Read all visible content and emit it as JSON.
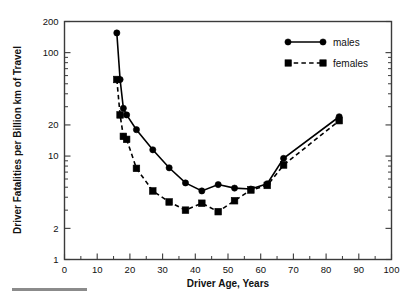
{
  "chart_data": {
    "type": "line",
    "title": "",
    "xlabel": "Driver Age, Years",
    "ylabel": "Driver Fatalities per Billion km of Travel",
    "yscale": "log",
    "xlim": [
      0,
      100
    ],
    "ylim": [
      1,
      200
    ],
    "grid": false,
    "legend_position": "top-right",
    "x_ticks": [
      0,
      10,
      20,
      30,
      40,
      50,
      60,
      70,
      80,
      90,
      100
    ],
    "x_tick_labels": [
      "0",
      "10",
      "20",
      "30",
      "40",
      "50",
      "60",
      "70",
      "80",
      "90",
      "100"
    ],
    "x_minor_ticks": [
      5,
      15,
      25,
      35,
      45,
      55,
      65,
      75,
      85,
      95
    ],
    "y_ticks": [
      1,
      2,
      10,
      20,
      100,
      200
    ],
    "y_tick_labels": [
      "1",
      "2",
      "10",
      "20",
      "100",
      "200"
    ],
    "y_minor_ticks": [
      3,
      4,
      5,
      6,
      7,
      8,
      9,
      30,
      40,
      50,
      60,
      70,
      80,
      90
    ],
    "series": [
      {
        "name": "males",
        "marker": "circle",
        "line": "solid",
        "color": "#000000",
        "x": [
          16,
          17,
          18,
          19,
          22,
          27,
          32,
          37,
          42,
          47,
          52,
          57,
          62,
          67,
          84
        ],
        "y": [
          155,
          55,
          29,
          25,
          18,
          11.5,
          7.7,
          5.5,
          4.6,
          5.3,
          4.9,
          4.8,
          5.4,
          9.5,
          24
        ]
      },
      {
        "name": "females",
        "marker": "square",
        "line": "dashed",
        "color": "#000000",
        "x": [
          16,
          17,
          18,
          19,
          22,
          27,
          32,
          37,
          42,
          47,
          52,
          57,
          62,
          67,
          84
        ],
        "y": [
          55,
          25,
          15.5,
          14.5,
          7.6,
          4.6,
          3.6,
          3.0,
          3.5,
          2.9,
          3.7,
          4.7,
          5.2,
          8.2,
          22
        ]
      }
    ]
  },
  "legend": {
    "entries": [
      {
        "label": "males"
      },
      {
        "label": "females"
      }
    ]
  },
  "axes": {
    "x_title": "Driver Age, Years",
    "y_title": "Driver Fatalities per Billion km of Travel"
  }
}
